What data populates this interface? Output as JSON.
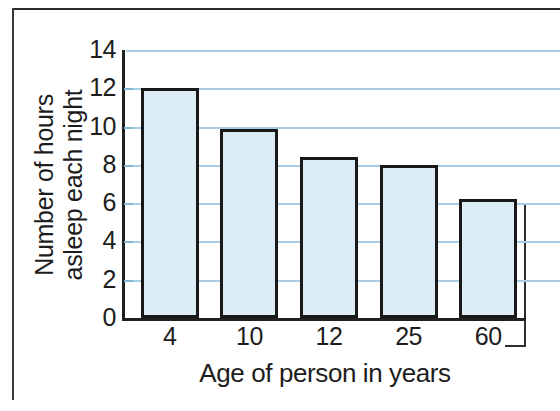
{
  "chart_data": {
    "type": "bar",
    "title": "",
    "categories": [
      "4",
      "10",
      "12",
      "25",
      "60"
    ],
    "values": [
      12,
      9.9,
      8.4,
      8,
      6.2
    ],
    "xlabel": "Age of person in years",
    "ylabel_line1": "Number of hours",
    "ylabel_line2": "asleep each night",
    "ylim": [
      0,
      14
    ],
    "yticks": [
      "14",
      "12",
      "10",
      "8",
      "6",
      "4",
      "2",
      "0"
    ],
    "ytick_values": [
      14,
      12,
      10,
      8,
      6,
      4,
      2,
      0
    ],
    "grid": true,
    "legend": "none",
    "colors": {
      "bar_fill": "#dcedf5",
      "bar_outline": "#181818",
      "gridline": "#a9cde4",
      "axis": "#202020",
      "text": "#1d1d1d",
      "frame": "#2b2b2b",
      "background": "#ffffff"
    }
  }
}
